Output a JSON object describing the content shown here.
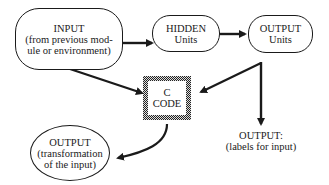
{
  "nodes": {
    "input": {
      "title": "INPUT",
      "line1": "(from previous mod-",
      "line2": "ule or environment)"
    },
    "hidden": {
      "title": "HIDDEN",
      "line1": "Units"
    },
    "output_units": {
      "title": "OUTPUT",
      "line1": "Units"
    },
    "c_code": {
      "title": "C",
      "line1": "CODE"
    },
    "output_transform": {
      "title": "OUTPUT",
      "line1": "(transformation",
      "line2": "of the input)"
    },
    "output_labels": {
      "title": "OUTPUT:",
      "line1": "(labels for input)"
    }
  },
  "edges": [
    {
      "from": "input",
      "to": "hidden"
    },
    {
      "from": "hidden",
      "to": "output_units"
    },
    {
      "from": "input",
      "to": "c_code"
    },
    {
      "from": "output_units",
      "to": "c_code"
    },
    {
      "from": "output_units",
      "to": "output_labels"
    },
    {
      "from": "c_code",
      "to": "output_transform"
    }
  ],
  "colors": {
    "stroke": "#1a1a1a",
    "background": "#ffffff"
  }
}
